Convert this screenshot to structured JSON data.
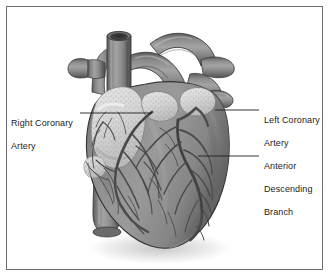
{
  "figure": {
    "style": "grayscale anatomical illustration",
    "frame_color": "#6e6e72",
    "background_color": "#ffffff"
  },
  "labels": {
    "right_coronary_artery": {
      "name": "Right Coronary Artery",
      "line1": "Right Coronary",
      "line2": "Artery",
      "side": "left",
      "leader_from_x": 80,
      "leader_to_x": 152,
      "leader_y": 113
    },
    "left_coronary_artery": {
      "name": "Left Coronary Artery",
      "line1": "Left Coronary",
      "line2": "Artery",
      "side": "right",
      "leader_from_x": 215,
      "leader_to_x": 259,
      "leader_y": 110
    },
    "anterior_descending_branch": {
      "name": "Anterior Descending Branch",
      "line1": "Anterior",
      "line2": "Descending",
      "line3": "Branch",
      "side": "right",
      "leader_from_x": 198,
      "leader_to_x": 259,
      "leader_y": 156
    }
  },
  "anatomy": {
    "myocardium_color": "#8e8e8e",
    "epicardial_fat_color": "#d4d4d4",
    "vessel_color": "#7a7a7a",
    "vessel_shadow_color": "#4a4a4a",
    "outline_color": "#3a3a3a",
    "structures": [
      "aorta",
      "pulmonary trunk",
      "superior vena cava",
      "brachiocephalic vessels",
      "left atrial appendage",
      "right atrium",
      "right ventricle",
      "left ventricle",
      "apex",
      "inferior vena cava",
      "right coronary artery",
      "left coronary artery",
      "anterior descending branch",
      "diagonal branches",
      "marginal branches"
    ]
  }
}
